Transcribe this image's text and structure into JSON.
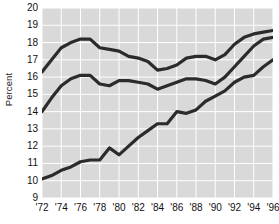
{
  "chart_data": {
    "type": "line",
    "title": "",
    "xlabel": "",
    "ylabel": "Percent",
    "xlim": [
      1972,
      1996
    ],
    "ylim": [
      9,
      20
    ],
    "grid": true,
    "legend": "none",
    "y_ticks": [
      9,
      10,
      11,
      12,
      13,
      14,
      15,
      16,
      17,
      18,
      19,
      20
    ],
    "y_tick_labels": [
      "9",
      "10",
      "11",
      "12",
      "13",
      "14",
      "15",
      "16",
      "17",
      "18",
      "19",
      "20"
    ],
    "x_ticks": [
      1972,
      1974,
      1976,
      1978,
      1980,
      1982,
      1984,
      1986,
      1988,
      1990,
      1992,
      1994,
      1996
    ],
    "x_tick_labels": [
      "'72",
      "'74",
      "'76",
      "'78",
      "'80",
      "'82",
      "'84",
      "'86",
      "'88",
      "'90",
      "'92",
      "'94",
      "'96"
    ],
    "x": [
      1972,
      1973,
      1974,
      1975,
      1976,
      1977,
      1978,
      1979,
      1980,
      1981,
      1982,
      1983,
      1984,
      1985,
      1986,
      1987,
      1988,
      1989,
      1990,
      1991,
      1992,
      1993,
      1994,
      1995,
      1996
    ],
    "series": [
      {
        "name": "upper",
        "color": "#2b2b2b",
        "values": [
          16.3,
          17.0,
          17.7,
          18.0,
          18.2,
          18.2,
          17.7,
          17.6,
          17.5,
          17.2,
          17.1,
          16.9,
          16.4,
          16.5,
          16.7,
          17.1,
          17.2,
          17.2,
          17.0,
          17.3,
          17.9,
          18.3,
          18.5,
          18.6,
          18.7
        ]
      },
      {
        "name": "middle",
        "color": "#2b2b2b",
        "values": [
          14.0,
          14.8,
          15.5,
          15.9,
          16.1,
          16.1,
          15.6,
          15.5,
          15.8,
          15.8,
          15.7,
          15.6,
          15.3,
          15.5,
          15.7,
          15.9,
          15.9,
          15.8,
          15.6,
          16.0,
          16.6,
          17.2,
          17.8,
          18.2,
          18.3
        ]
      },
      {
        "name": "lower",
        "color": "#2b2b2b",
        "values": [
          10.1,
          10.3,
          10.6,
          10.8,
          11.1,
          11.2,
          11.2,
          11.9,
          11.5,
          12.0,
          12.5,
          12.9,
          13.3,
          13.3,
          14.0,
          13.9,
          14.1,
          14.6,
          14.9,
          15.2,
          15.7,
          16.0,
          16.1,
          16.6,
          17.0
        ]
      }
    ]
  },
  "colors": {
    "plot_background": "#d9d9d9",
    "gridline": "#ffffff",
    "line": "#2b2b2b",
    "tick_text": "#111111",
    "page_background": "#ffffff"
  }
}
